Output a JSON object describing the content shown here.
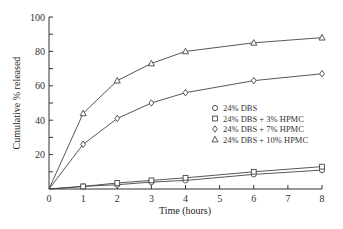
{
  "chart_data": {
    "type": "line",
    "title": "",
    "xlabel": "Time (hours)",
    "ylabel": "Cumulative % released",
    "xlim": [
      0,
      8
    ],
    "ylim": [
      0,
      100
    ],
    "x_ticks": [
      0,
      1,
      2,
      3,
      4,
      5,
      6,
      7,
      8
    ],
    "y_ticks": [
      20,
      40,
      60,
      80,
      100
    ],
    "y_tick_labels_origin": "0",
    "grid": false,
    "legend_position": "center-right",
    "x": [
      0,
      1,
      2,
      3,
      4,
      6,
      8
    ],
    "series": [
      {
        "name": "24% DBS",
        "marker": "circle",
        "values": [
          0,
          1.5,
          2.5,
          4,
          5,
          8.5,
          11
        ]
      },
      {
        "name": "24% DBS + 3% HPMC",
        "marker": "square",
        "values": [
          0,
          1.5,
          3.5,
          5,
          6.5,
          10,
          13
        ]
      },
      {
        "name": "24% DBS + 7% HPMC",
        "marker": "diamond",
        "values": [
          0,
          26,
          41,
          50,
          56,
          63,
          67
        ]
      },
      {
        "name": "24% DBS + 10% HPMC",
        "marker": "triangle",
        "values": [
          0,
          44,
          63,
          73,
          80,
          85,
          88
        ]
      }
    ],
    "colors": {
      "line": "#444444",
      "axis": "#333333",
      "marker_fill": "#ffffff"
    }
  },
  "legend": {
    "items": [
      {
        "symbol": "○",
        "label": "24% DBS"
      },
      {
        "symbol": "□",
        "label": "24% DBS + 3% HPMC"
      },
      {
        "symbol": "◇",
        "label": "24% DBS + 7% HPMC"
      },
      {
        "symbol": "△",
        "label": "24% DBS + 10% HPMC"
      }
    ]
  }
}
